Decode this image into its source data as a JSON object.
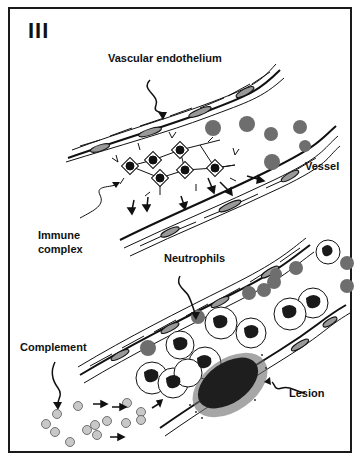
{
  "figure": {
    "panel_number": "III",
    "labels": {
      "vascular_endothelium": "Vascular endothelium",
      "vessel": "Vessel",
      "immune_complex_line1": "Immune",
      "immune_complex_line2": "complex",
      "neutrophils": "Neutrophils",
      "complement": "Complement",
      "lesion": "Lesion"
    },
    "colors": {
      "ink": "#111111",
      "rbc": "#6e6e6e",
      "complement": "#c8c8c8",
      "lesion": "#1e1e1e"
    }
  }
}
